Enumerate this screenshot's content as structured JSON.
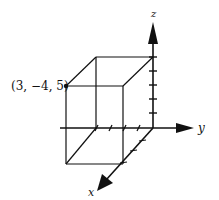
{
  "diagram": {
    "point_label": "(3, −4, 5)",
    "axes": {
      "x": "x",
      "y": "y",
      "z": "z"
    },
    "point": {
      "x": 3,
      "y": -4,
      "z": 5
    },
    "line_color": "#111111"
  }
}
